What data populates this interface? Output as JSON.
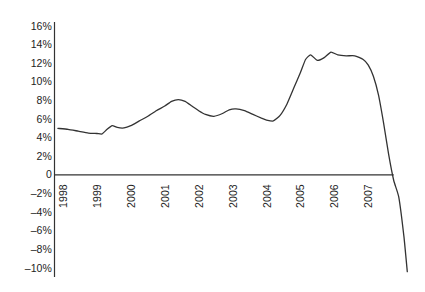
{
  "chart_data": {
    "type": "line",
    "title": "",
    "subtitle": "",
    "xlabel": "",
    "ylabel": "",
    "grid": false,
    "legend": "none",
    "xlim": [
      1997.75,
      2008.2
    ],
    "ylim": [
      -10,
      16
    ],
    "x_tick_labels": [
      "1998",
      "1999",
      "2000",
      "2001",
      "2002",
      "2003",
      "2004",
      "2005",
      "2006",
      "2007"
    ],
    "x_tick_values": [
      1998,
      1999,
      2000,
      2001,
      2002,
      2003,
      2004,
      2005,
      2006,
      2007
    ],
    "y_tick_labels": [
      "16%",
      "14%",
      "12%",
      "10%",
      "8%",
      "6%",
      "4%",
      "2%",
      "0",
      "–2%",
      "–4%",
      "–6%",
      "–8%",
      "–10%"
    ],
    "y_tick_values": [
      16,
      14,
      12,
      10,
      8,
      6,
      4,
      2,
      0,
      -2,
      -4,
      -6,
      -8,
      -10
    ],
    "series": [
      {
        "name": "series-1",
        "color": "#333333",
        "x": [
          1997.85,
          1998.15,
          1998.45,
          1998.75,
          1999.0,
          1999.15,
          1999.3,
          1999.45,
          1999.6,
          1999.8,
          2000.0,
          2000.25,
          2000.5,
          2000.75,
          2001.0,
          2001.2,
          2001.4,
          2001.6,
          2001.8,
          2002.0,
          2002.2,
          2002.45,
          2002.7,
          2002.9,
          2003.1,
          2003.35,
          2003.6,
          2003.85,
          2004.0,
          2004.2,
          2004.4,
          2004.6,
          2004.8,
          2005.0,
          2005.15,
          2005.3,
          2005.5,
          2005.7,
          2005.9,
          2006.1,
          2006.35,
          2006.6,
          2006.85,
          2007.0,
          2007.15,
          2007.3,
          2007.45,
          2007.6,
          2007.75,
          2007.9,
          2008.05,
          2008.15
        ],
        "y": [
          5.0,
          4.9,
          4.7,
          4.5,
          4.45,
          4.4,
          4.9,
          5.3,
          5.1,
          5.05,
          5.3,
          5.8,
          6.3,
          6.9,
          7.4,
          7.9,
          8.1,
          7.9,
          7.4,
          6.9,
          6.5,
          6.3,
          6.6,
          7.0,
          7.1,
          6.9,
          6.5,
          6.1,
          5.9,
          5.8,
          6.4,
          7.6,
          9.3,
          11.0,
          12.4,
          12.9,
          12.3,
          12.6,
          13.2,
          12.9,
          12.8,
          12.8,
          12.4,
          11.8,
          10.6,
          8.6,
          5.6,
          2.2,
          -0.6,
          -2.4,
          -6.6,
          -10.4
        ]
      }
    ],
    "axes": {
      "zero_line": 0,
      "axis_color": "#333333",
      "y_axis_x": 1997.7,
      "zero_line_x_end": 2007.75
    }
  }
}
